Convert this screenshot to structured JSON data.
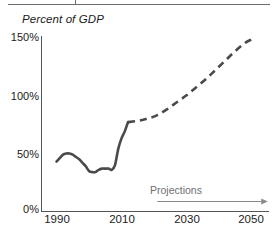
{
  "chart_data": {
    "type": "line",
    "title": "Percent of GDP",
    "xlabel": "",
    "ylabel": "Percent of GDP",
    "xlim": [
      1988,
      2052
    ],
    "ylim": [
      0,
      150
    ],
    "grid": false,
    "legend": "none",
    "y_ticks": [
      "0%",
      "50%",
      "100%",
      "150%"
    ],
    "y_tick_values": [
      0,
      50,
      100,
      150
    ],
    "x_ticks": [
      "1990",
      "2010",
      "2030",
      "2050"
    ],
    "x_tick_values": [
      1990,
      2010,
      2030,
      2050
    ],
    "annotations": [
      {
        "name": "projections-arrow-label",
        "text": "Projections",
        "arrow": "right",
        "arrow_from_year": 2021,
        "arrow_to_year": 2055
      }
    ],
    "series": [
      {
        "name": "Federal debt held by the public",
        "style": "solid",
        "color": "#4a4a4a",
        "x": [
          1990,
          1991,
          1992,
          1993,
          1994,
          1995,
          1996,
          1997,
          1998,
          1999,
          2000,
          2001,
          2002,
          2003,
          2004,
          2005,
          2006,
          2007,
          2008,
          2009,
          2010,
          2011,
          2012
        ],
        "values": [
          42,
          45,
          48,
          49,
          49,
          48,
          46,
          44,
          41,
          38,
          34,
          33,
          33,
          35,
          36,
          36,
          36,
          35,
          39,
          53,
          62,
          68,
          76
        ]
      },
      {
        "name": "Projected federal debt held by the public",
        "style": "dashed",
        "color": "#4a4a4a",
        "x": [
          2012,
          2015,
          2018,
          2021,
          2024,
          2027,
          2030,
          2033,
          2036,
          2039,
          2042,
          2045,
          2048,
          2050
        ],
        "values": [
          76,
          77,
          79,
          82,
          87,
          93,
          99,
          106,
          113,
          121,
          129,
          137,
          144,
          147
        ]
      }
    ]
  },
  "header": {
    "rule_present": true,
    "tick_present": true
  }
}
